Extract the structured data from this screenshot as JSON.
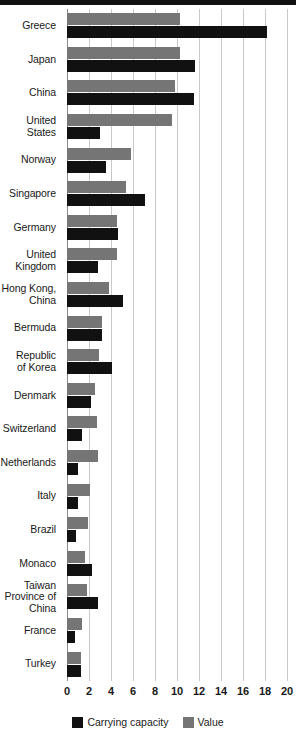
{
  "chart_data": {
    "type": "bar",
    "orientation": "horizontal",
    "title": "",
    "subtitle": "",
    "xlabel": "",
    "ylabel": "",
    "xlim": [
      0,
      20
    ],
    "xticks": [
      0,
      2,
      4,
      6,
      8,
      10,
      12,
      14,
      16,
      18,
      20
    ],
    "xtick_labels": [
      "0",
      "2",
      "4",
      "6",
      "8",
      "10",
      "12",
      "14",
      "16",
      "18",
      "20"
    ],
    "grid": true,
    "grid_axis": "x",
    "legend_position": "bottom",
    "categories": [
      "Greece",
      "Japan",
      "China",
      "United\nStates",
      "Norway",
      "Singapore",
      "Germany",
      "United\nKingdom",
      "Hong Kong,\nChina",
      "Bermuda",
      "Republic\nof Korea",
      "Denmark",
      "Switzerland",
      "Netherlands",
      "Italy",
      "Brazil",
      "Monaco",
      "Taiwan\nProvince of\nChina",
      "France",
      "Turkey"
    ],
    "series": [
      {
        "name": "Value",
        "color": "#757575",
        "values": [
          10.3,
          10.3,
          9.8,
          9.5,
          5.8,
          5.4,
          4.5,
          4.5,
          3.8,
          3.2,
          2.9,
          2.5,
          2.7,
          2.8,
          2.1,
          1.9,
          1.6,
          1.8,
          1.4,
          1.3
        ]
      },
      {
        "name": "Carrying capacity",
        "color": "#111111",
        "values": [
          18.2,
          11.6,
          11.5,
          3.0,
          3.5,
          7.1,
          4.6,
          2.8,
          5.1,
          3.2,
          4.1,
          2.2,
          1.4,
          1.0,
          1.0,
          0.8,
          2.3,
          2.8,
          0.7,
          1.3
        ]
      }
    ]
  },
  "legend": {
    "items": [
      {
        "label": "Carrying capacity",
        "swatch": "capacity"
      },
      {
        "label": "Value",
        "swatch": "value"
      }
    ]
  },
  "colors": {
    "capacity": "#111111",
    "value": "#757575",
    "grid": "#c9c9c9",
    "axis": "#8a8a8a",
    "rule": "#111111",
    "text": "#1a1a1a",
    "background": "#ffffff"
  }
}
